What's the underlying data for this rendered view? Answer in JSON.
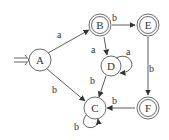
{
  "diagram": {
    "type": "finite-automaton",
    "start_state": "A",
    "states": [
      {
        "id": "A",
        "label": "A",
        "x": 40,
        "y": 60,
        "accepting": false
      },
      {
        "id": "B",
        "label": "B",
        "x": 100,
        "y": 25,
        "accepting": true
      },
      {
        "id": "E",
        "label": "E",
        "x": 148,
        "y": 25,
        "accepting": true
      },
      {
        "id": "D",
        "label": "D",
        "x": 111,
        "y": 66,
        "accepting": false
      },
      {
        "id": "C",
        "label": "C",
        "x": 95,
        "y": 108,
        "accepting": false
      },
      {
        "id": "F",
        "label": "F",
        "x": 148,
        "y": 108,
        "accepting": true
      }
    ],
    "transitions": [
      {
        "from": "A",
        "to": "B",
        "label": "a"
      },
      {
        "from": "A",
        "to": "C",
        "label": "b"
      },
      {
        "from": "B",
        "to": "E",
        "label": "b"
      },
      {
        "from": "B",
        "to": "D",
        "label": "a"
      },
      {
        "from": "D",
        "to": "D",
        "label": "a"
      },
      {
        "from": "D",
        "to": "C",
        "label": "b"
      },
      {
        "from": "E",
        "to": "F",
        "label": "b"
      },
      {
        "from": "F",
        "to": "C",
        "label": "b"
      },
      {
        "from": "C",
        "to": "C",
        "label": "b"
      }
    ]
  }
}
